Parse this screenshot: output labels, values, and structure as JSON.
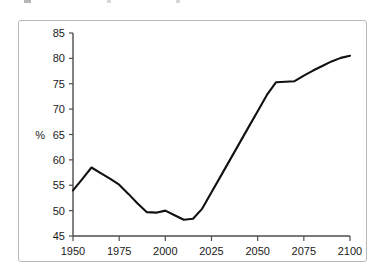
{
  "figure": {
    "background_color": "#ffffff",
    "border_color": "#b9b9b9",
    "title_cropped": true
  },
  "chart_data": {
    "type": "line",
    "title": "",
    "xlabel": "",
    "ylabel": "%",
    "xlim": [
      1950,
      2100
    ],
    "ylim": [
      45,
      85
    ],
    "xticks": [
      1950,
      1975,
      2000,
      2025,
      2050,
      2075,
      2100
    ],
    "xtick_labels": [
      "1950",
      "1975",
      "2000",
      "2025",
      "2050",
      "2075",
      "2100"
    ],
    "yticks": [
      45,
      50,
      55,
      60,
      65,
      70,
      75,
      80,
      85
    ],
    "ytick_labels": [
      "45",
      "50",
      "55",
      "60",
      "65",
      "70",
      "75",
      "80",
      "85"
    ],
    "grid": false,
    "legend": false,
    "line_color": "#111111",
    "series": [
      {
        "name": "percent",
        "x": [
          1950,
          1955,
          1960,
          1965,
          1970,
          1975,
          1980,
          1985,
          1990,
          1995,
          2000,
          2005,
          2010,
          2015,
          2020,
          2025,
          2030,
          2035,
          2040,
          2045,
          2050,
          2055,
          2060,
          2065,
          2070,
          2075,
          2080,
          2085,
          2090,
          2095,
          2100
        ],
        "values": [
          54.0,
          56.2,
          58.5,
          57.4,
          56.3,
          55.1,
          53.3,
          51.4,
          49.7,
          49.6,
          50.0,
          49.1,
          48.2,
          48.4,
          50.4,
          53.6,
          56.8,
          60.0,
          63.2,
          66.4,
          69.6,
          72.8,
          75.3,
          75.4,
          75.5,
          76.6,
          77.6,
          78.5,
          79.4,
          80.1,
          80.5
        ]
      }
    ]
  }
}
